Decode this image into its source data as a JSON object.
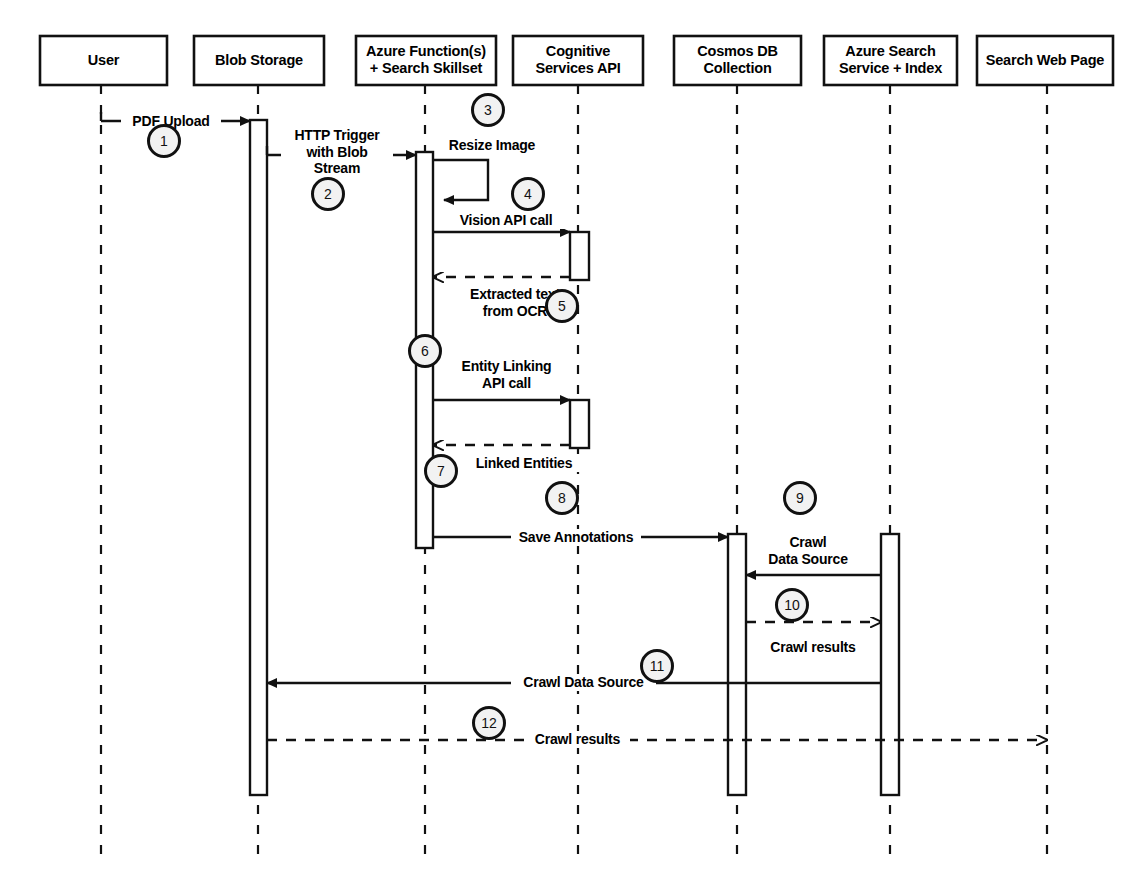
{
  "diagram": {
    "type": "sequence-diagram",
    "width": 1145,
    "height": 891,
    "colors": {
      "line": "#111111",
      "box_fill": "#ffffff",
      "circle_fill": "#f2f2f2",
      "text": "#000000"
    }
  },
  "participants": [
    {
      "id": "user",
      "label": "User",
      "x": 101,
      "box": {
        "x": 40,
        "y": 36,
        "w": 127,
        "h": 49
      }
    },
    {
      "id": "blob",
      "label": "Blob Storage",
      "x": 258,
      "box": {
        "x": 194,
        "y": 36,
        "w": 130,
        "h": 49
      }
    },
    {
      "id": "func",
      "label": "Azure Function(s)\n+ Search Skillset",
      "x": 425,
      "box": {
        "x": 356,
        "y": 36,
        "w": 140,
        "h": 49
      }
    },
    {
      "id": "cognitive",
      "label": "Cognitive\nServices API",
      "x": 578,
      "box": {
        "x": 513,
        "y": 36,
        "w": 130,
        "h": 49
      }
    },
    {
      "id": "cosmos",
      "label": "Cosmos DB\nCollection",
      "x": 737,
      "box": {
        "x": 674,
        "y": 36,
        "w": 127,
        "h": 49
      }
    },
    {
      "id": "search",
      "label": "Azure Search\nService + Index",
      "x": 890,
      "box": {
        "x": 824,
        "y": 36,
        "w": 133,
        "h": 49
      }
    },
    {
      "id": "webpage",
      "label": "Search Web Page",
      "x": 1047,
      "box": {
        "x": 977,
        "y": 36,
        "w": 136,
        "h": 49
      }
    }
  ],
  "activations": [
    {
      "participant": "blob",
      "x": 250,
      "y": 120,
      "w": 17,
      "h": 675
    },
    {
      "participant": "func",
      "x": 416,
      "y": 152,
      "w": 17,
      "h": 396
    },
    {
      "participant": "cognitive",
      "x": 570,
      "y": 232,
      "w": 19,
      "h": 48
    },
    {
      "participant": "cognitive",
      "x": 570,
      "y": 400,
      "w": 19,
      "h": 48
    },
    {
      "participant": "cosmos",
      "x": 728,
      "y": 534,
      "w": 18,
      "h": 261
    },
    {
      "participant": "search",
      "x": 881,
      "y": 534,
      "w": 18,
      "h": 261
    }
  ],
  "messages": [
    {
      "num": "1",
      "label": "PDF Upload",
      "from": "user",
      "to": "blob",
      "style": "solid",
      "y": 121,
      "num_pos": {
        "x": 164,
        "y": 141
      },
      "label_pos": {
        "x": 121,
        "y": 113,
        "w": 100
      }
    },
    {
      "num": "2",
      "label": "HTTP Trigger\nwith Blob\nStream",
      "from": "blob",
      "to": "func",
      "style": "solid",
      "y": 155,
      "num_pos": {
        "x": 328,
        "y": 194
      },
      "label_pos": {
        "x": 281,
        "y": 127,
        "w": 112
      }
    },
    {
      "num": "3",
      "label": "Resize Image",
      "from": "func",
      "to": "func",
      "style": "self",
      "y": 168,
      "num_pos": {
        "x": 488,
        "y": 110
      },
      "label_pos": {
        "x": 437,
        "y": 137,
        "w": 110
      }
    },
    {
      "num": "4",
      "label": "Vision API call",
      "from": "func",
      "to": "cognitive",
      "style": "solid",
      "y": 232,
      "num_pos": {
        "x": 528,
        "y": 194
      },
      "label_pos": {
        "x": 441,
        "y": 212,
        "w": 130
      }
    },
    {
      "num": "5",
      "label": "Extracted text\nfrom OCR",
      "from": "cognitive",
      "to": "func",
      "style": "dashed",
      "y": 277,
      "num_pos": {
        "x": 562,
        "y": 306
      },
      "label_pos": {
        "x": 460,
        "y": 286,
        "w": 110
      }
    },
    {
      "num": "6",
      "label": "Entity Linking\nAPI call",
      "from": "func",
      "to": "cognitive",
      "style": "solid",
      "y": 400,
      "num_pos": {
        "x": 425,
        "y": 351
      },
      "label_pos": {
        "x": 449,
        "y": 358,
        "w": 115
      }
    },
    {
      "num": "7",
      "label": "Linked Entities",
      "from": "cognitive",
      "to": "func",
      "style": "dashed",
      "y": 445,
      "num_pos": {
        "x": 441,
        "y": 471
      },
      "label_pos": {
        "x": 464,
        "y": 455,
        "w": 120
      }
    },
    {
      "num": "8",
      "label": "Save Annotations",
      "from": "func",
      "to": "cosmos",
      "style": "solid",
      "y": 537,
      "num_pos": {
        "x": 562,
        "y": 498
      },
      "label_pos": {
        "x": 511,
        "y": 529,
        "w": 130
      }
    },
    {
      "num": "9",
      "label": "Crawl\nData Source",
      "from": "search",
      "to": "cosmos",
      "style": "solid",
      "y": 575,
      "num_pos": {
        "x": 800,
        "y": 498
      },
      "label_pos": {
        "x": 758,
        "y": 534,
        "w": 100
      }
    },
    {
      "num": "10",
      "label": "Crawl results",
      "from": "cosmos",
      "to": "search",
      "style": "dashed",
      "y": 622,
      "num_pos": {
        "x": 792,
        "y": 605
      },
      "label_pos": {
        "x": 763,
        "y": 639,
        "w": 100
      }
    },
    {
      "num": "11",
      "label": "Crawl Data Source",
      "from": "search",
      "to": "blob",
      "style": "solid",
      "y": 683,
      "num_pos": {
        "x": 657,
        "y": 666
      },
      "label_pos": {
        "x": 511,
        "y": 674,
        "w": 145
      }
    },
    {
      "num": "12",
      "label": "Crawl results",
      "from": "blob",
      "to": "webpage",
      "style": "dashed",
      "y": 740,
      "num_pos": {
        "x": 489,
        "y": 723
      },
      "label_pos": {
        "x": 525,
        "y": 731,
        "w": 105
      }
    }
  ]
}
